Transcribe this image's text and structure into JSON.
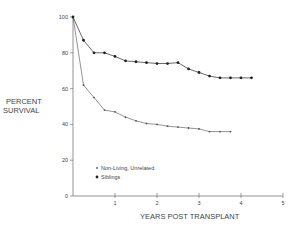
{
  "chart_data": {
    "type": "line",
    "title": "",
    "xlabel": "YEARS POST TRANSPLANT",
    "ylabel": "PERCENT SURVIVAL",
    "ylabel_lines": [
      "PERCENT",
      "SURVIVAL"
    ],
    "xlim": [
      0,
      5
    ],
    "ylim": [
      0,
      100
    ],
    "x_ticks": [
      1,
      2,
      3,
      4,
      5
    ],
    "y_ticks": [
      0,
      20,
      40,
      60,
      80,
      100
    ],
    "grid": false,
    "legend_position": "lower-left inside",
    "series": [
      {
        "name": "Non-Living, Unrelated",
        "marker": "small-dot",
        "x": [
          0,
          0.25,
          0.5,
          0.75,
          1.0,
          1.25,
          1.5,
          1.75,
          2.0,
          2.25,
          2.5,
          2.75,
          3.0,
          3.25,
          3.5,
          3.75
        ],
        "values": [
          100,
          62,
          55,
          48,
          47,
          44,
          42,
          40.5,
          40,
          39,
          38.5,
          38,
          37.5,
          36,
          36,
          36
        ]
      },
      {
        "name": "Siblings",
        "marker": "filled-dot",
        "x": [
          0,
          0.25,
          0.5,
          0.75,
          1.0,
          1.25,
          1.5,
          1.75,
          2.0,
          2.25,
          2.5,
          2.75,
          3.0,
          3.25,
          3.5,
          3.75,
          4.0,
          4.25
        ],
        "values": [
          100,
          87,
          80,
          80,
          78,
          75.5,
          75,
          74.5,
          74,
          74,
          74.5,
          71,
          69,
          67,
          66,
          66,
          66,
          66
        ]
      }
    ]
  },
  "legend": {
    "items": [
      {
        "label": "Non-Living, Unrelated",
        "marker": "×"
      },
      {
        "label": "Siblings",
        "marker": "•"
      }
    ]
  }
}
